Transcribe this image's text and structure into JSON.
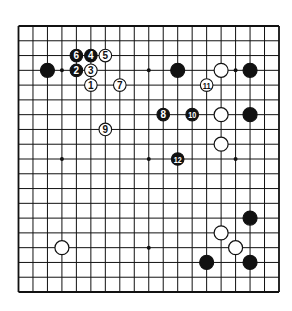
{
  "diagram": {
    "type": "go-board",
    "size": 19,
    "line_color": "#111111",
    "background": "#ffffff",
    "hoshi": [
      [
        3,
        3
      ],
      [
        9,
        3
      ],
      [
        15,
        3
      ],
      [
        3,
        9
      ],
      [
        9,
        9
      ],
      [
        15,
        9
      ],
      [
        3,
        15
      ],
      [
        9,
        15
      ],
      [
        15,
        15
      ]
    ],
    "stones": [
      {
        "color": "black",
        "col": 2,
        "row": 3
      },
      {
        "color": "black",
        "col": 11,
        "row": 3
      },
      {
        "color": "black",
        "col": 16,
        "row": 3
      },
      {
        "color": "black",
        "col": 16,
        "row": 6
      },
      {
        "color": "black",
        "col": 16,
        "row": 13
      },
      {
        "color": "black",
        "col": 13,
        "row": 16
      },
      {
        "color": "black",
        "col": 16,
        "row": 16
      },
      {
        "color": "white",
        "col": 14,
        "row": 3
      },
      {
        "color": "white",
        "col": 14,
        "row": 6
      },
      {
        "color": "white",
        "col": 14,
        "row": 8
      },
      {
        "color": "white",
        "col": 3,
        "row": 15
      },
      {
        "color": "white",
        "col": 14,
        "row": 14
      },
      {
        "color": "white",
        "col": 15,
        "row": 15
      }
    ],
    "moves": [
      {
        "n": "1",
        "color": "white",
        "col": 5,
        "row": 4
      },
      {
        "n": "2",
        "color": "black",
        "col": 4,
        "row": 3
      },
      {
        "n": "3",
        "color": "white",
        "col": 5,
        "row": 3
      },
      {
        "n": "4",
        "color": "black",
        "col": 5,
        "row": 2
      },
      {
        "n": "5",
        "color": "white",
        "col": 6,
        "row": 2
      },
      {
        "n": "6",
        "color": "black",
        "col": 4,
        "row": 2
      },
      {
        "n": "7",
        "color": "white",
        "col": 7,
        "row": 4
      },
      {
        "n": "8",
        "color": "black",
        "col": 10,
        "row": 6
      },
      {
        "n": "9",
        "color": "white",
        "col": 6,
        "row": 7
      },
      {
        "n": "10",
        "color": "black",
        "col": 12,
        "row": 6
      },
      {
        "n": "11",
        "color": "white",
        "col": 13,
        "row": 4
      },
      {
        "n": "12",
        "color": "black",
        "col": 11,
        "row": 9
      }
    ]
  }
}
